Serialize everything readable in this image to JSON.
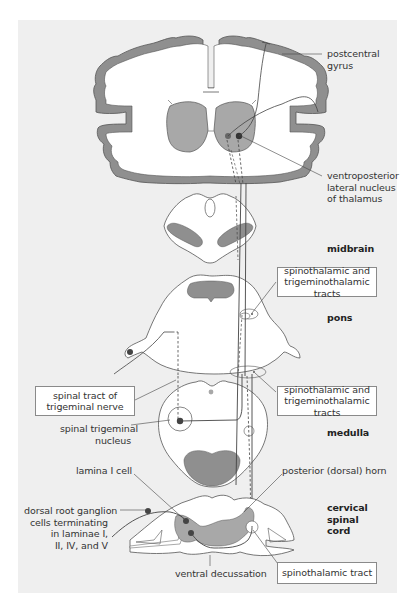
{
  "figure": {
    "colors": {
      "panel_bg": "#efefef",
      "cortex_gray": "#8f8f8f",
      "nucleus_gray": "#a8a8a8",
      "tissue_white": "#ffffff",
      "outline": "#555555",
      "neuron_dot": "#444444"
    }
  },
  "labels": {
    "postcentral_gyrus": [
      "postcentral",
      "gyrus"
    ],
    "vpl_nucleus": [
      "ventroposterior",
      "lateral nucleus",
      "of thalamus"
    ],
    "midbrain": "midbrain",
    "pons": "pons",
    "medulla": "medulla",
    "cervical_spinal_cord": [
      "cervical",
      "spinal",
      "cord"
    ],
    "spinal_trigeminal_nucleus": [
      "spinal trigeminal",
      "nucleus"
    ],
    "lamina_i_cell": "lamina I cell",
    "drg_cells": [
      "dorsal root ganglion",
      "cells terminating",
      "in laminae I,",
      "II, IV, and V"
    ],
    "posterior_horn": "posterior (dorsal) horn",
    "ventral_decussation": "ventral decussation"
  },
  "boxes": {
    "tracts_pons": [
      "spinothalamic and",
      "trigeminothalamic tracts"
    ],
    "tracts_medulla": [
      "spinothalamic and",
      "trigeminothalamic tracts"
    ],
    "spinal_tract_trigeminal": [
      "spinal tract of",
      "trigeminal nerve"
    ],
    "spinothalamic_tract": "spinothalamic tract"
  }
}
